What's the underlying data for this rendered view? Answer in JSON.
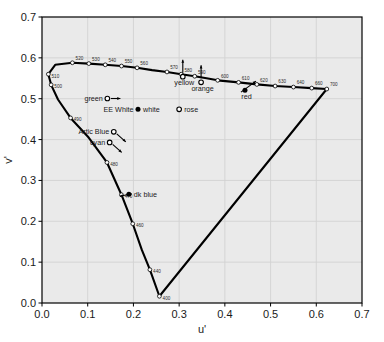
{
  "chart_data": {
    "type": "scatter",
    "title": "",
    "xlabel": "u'",
    "ylabel": "v'",
    "xlim": [
      0.0,
      0.7
    ],
    "ylim": [
      0.0,
      0.7
    ],
    "xticks": [
      "0.0",
      "0.1",
      "0.2",
      "0.3",
      "0.4",
      "0.5",
      "0.6",
      "0.7"
    ],
    "yticks": [
      "0.0",
      "0.1",
      "0.2",
      "0.3",
      "0.4",
      "0.5",
      "0.6",
      "0.7"
    ],
    "grid": true,
    "legend": "none",
    "spectral_locus": {
      "name": "Spectral locus (CIE 1976 u'v')",
      "points": [
        {
          "u": 0.2568,
          "v": 0.0165
        },
        {
          "u": 0.236,
          "v": 0.0815
        },
        {
          "u": 0.2184,
          "v": 0.13
        },
        {
          "u": 0.1985,
          "v": 0.194
        },
        {
          "u": 0.1738,
          "v": 0.265
        },
        {
          "u": 0.1421,
          "v": 0.344
        },
        {
          "u": 0.1021,
          "v": 0.405
        },
        {
          "u": 0.0625,
          "v": 0.453
        },
        {
          "u": 0.035,
          "v": 0.498
        },
        {
          "u": 0.02,
          "v": 0.534
        },
        {
          "u": 0.0139,
          "v": 0.56
        },
        {
          "u": 0.0289,
          "v": 0.583
        },
        {
          "u": 0.0665,
          "v": 0.588
        },
        {
          "u": 0.1025,
          "v": 0.586
        },
        {
          "u": 0.1384,
          "v": 0.583
        },
        {
          "u": 0.1739,
          "v": 0.58
        },
        {
          "u": 0.208,
          "v": 0.5756
        },
        {
          "u": 0.2408,
          "v": 0.57
        },
        {
          "u": 0.2734,
          "v": 0.5655
        },
        {
          "u": 0.3045,
          "v": 0.56
        },
        {
          "u": 0.334,
          "v": 0.555
        },
        {
          "u": 0.36,
          "v": 0.55
        },
        {
          "u": 0.3843,
          "v": 0.545
        },
        {
          "u": 0.43,
          "v": 0.54
        },
        {
          "u": 0.47,
          "v": 0.535
        },
        {
          "u": 0.51,
          "v": 0.531
        },
        {
          "u": 0.55,
          "v": 0.5285
        },
        {
          "u": 0.59,
          "v": 0.526
        },
        {
          "u": 0.623,
          "v": 0.5237
        }
      ],
      "wavelength_marks": [
        {
          "label": "400",
          "u": 0.2568,
          "v": 0.0165
        },
        {
          "label": "440",
          "u": 0.236,
          "v": 0.0815
        },
        {
          "label": "460",
          "u": 0.1985,
          "v": 0.194
        },
        {
          "label": "470",
          "u": 0.1738,
          "v": 0.265
        },
        {
          "label": "480",
          "u": 0.1421,
          "v": 0.344
        },
        {
          "label": "490",
          "u": 0.0625,
          "v": 0.453
        },
        {
          "label": "500",
          "u": 0.02,
          "v": 0.534
        },
        {
          "label": "510",
          "u": 0.0139,
          "v": 0.56
        },
        {
          "label": "520",
          "u": 0.0665,
          "v": 0.588
        },
        {
          "label": "530",
          "u": 0.1025,
          "v": 0.586
        },
        {
          "label": "540",
          "u": 0.1384,
          "v": 0.583
        },
        {
          "label": "550",
          "u": 0.1739,
          "v": 0.58
        },
        {
          "label": "560",
          "u": 0.208,
          "v": 0.5756
        },
        {
          "label": "570",
          "u": 0.2734,
          "v": 0.5655
        },
        {
          "label": "580",
          "u": 0.3045,
          "v": 0.56
        },
        {
          "label": "590",
          "u": 0.334,
          "v": 0.555
        },
        {
          "label": "600",
          "u": 0.3843,
          "v": 0.545
        },
        {
          "label": "610",
          "u": 0.43,
          "v": 0.54
        },
        {
          "label": "620",
          "u": 0.47,
          "v": 0.535
        },
        {
          "label": "630",
          "u": 0.51,
          "v": 0.531
        },
        {
          "label": "640",
          "u": 0.55,
          "v": 0.5285
        },
        {
          "label": "660",
          "u": 0.59,
          "v": 0.526
        },
        {
          "label": "700",
          "u": 0.623,
          "v": 0.5237
        }
      ]
    },
    "purple_line": {
      "name": "Line of purples",
      "from": {
        "u": 0.623,
        "v": 0.5237
      },
      "to": {
        "u": 0.2568,
        "v": 0.0165
      }
    },
    "color_points": [
      {
        "label": "green",
        "u": 0.143,
        "v": 0.5005,
        "marker": "open-circle",
        "label_side": "left",
        "arrow": "right"
      },
      {
        "label": "yellow",
        "u": 0.308,
        "v": 0.554,
        "marker": "open-circle",
        "label_side": "below",
        "arrow": "up"
      },
      {
        "label": "orange",
        "u": 0.348,
        "v": 0.54,
        "marker": "open-circle",
        "label_side": "below",
        "arrow": "up"
      },
      {
        "label": "red",
        "u": 0.444,
        "v": 0.521,
        "marker": "filled-dot",
        "label_side": "below",
        "arrow": "upright"
      },
      {
        "label": "EE White",
        "u": 0.21,
        "v": 0.474,
        "marker": "filled-dot",
        "label_side": "left",
        "arrow": "none"
      },
      {
        "label": "white",
        "u": 0.21,
        "v": 0.474,
        "marker": "none",
        "label_side": "right",
        "arrow": "none"
      },
      {
        "label": "rose",
        "u": 0.3,
        "v": 0.474,
        "marker": "open-circle",
        "label_side": "right",
        "arrow": "none"
      },
      {
        "label": "Artic Blue",
        "u": 0.157,
        "v": 0.419,
        "marker": "open-circle",
        "label_side": "left",
        "arrow": "downright"
      },
      {
        "label": "cyan",
        "u": 0.148,
        "v": 0.393,
        "marker": "open-circle",
        "label_side": "left",
        "arrow": "downright"
      },
      {
        "label": "dk blue",
        "u": 0.19,
        "v": 0.266,
        "marker": "filled-dot",
        "label_side": "right",
        "arrow": "left"
      }
    ]
  },
  "axes": {
    "x_title": "u'",
    "y_title": "v'"
  },
  "colors": {
    "plot_background": "#eaeaea",
    "frame": "#000000",
    "grid": "#d2d2d2",
    "locus": "#000000",
    "marker_fill": "#ffffff",
    "marker_stroke": "#000000"
  }
}
